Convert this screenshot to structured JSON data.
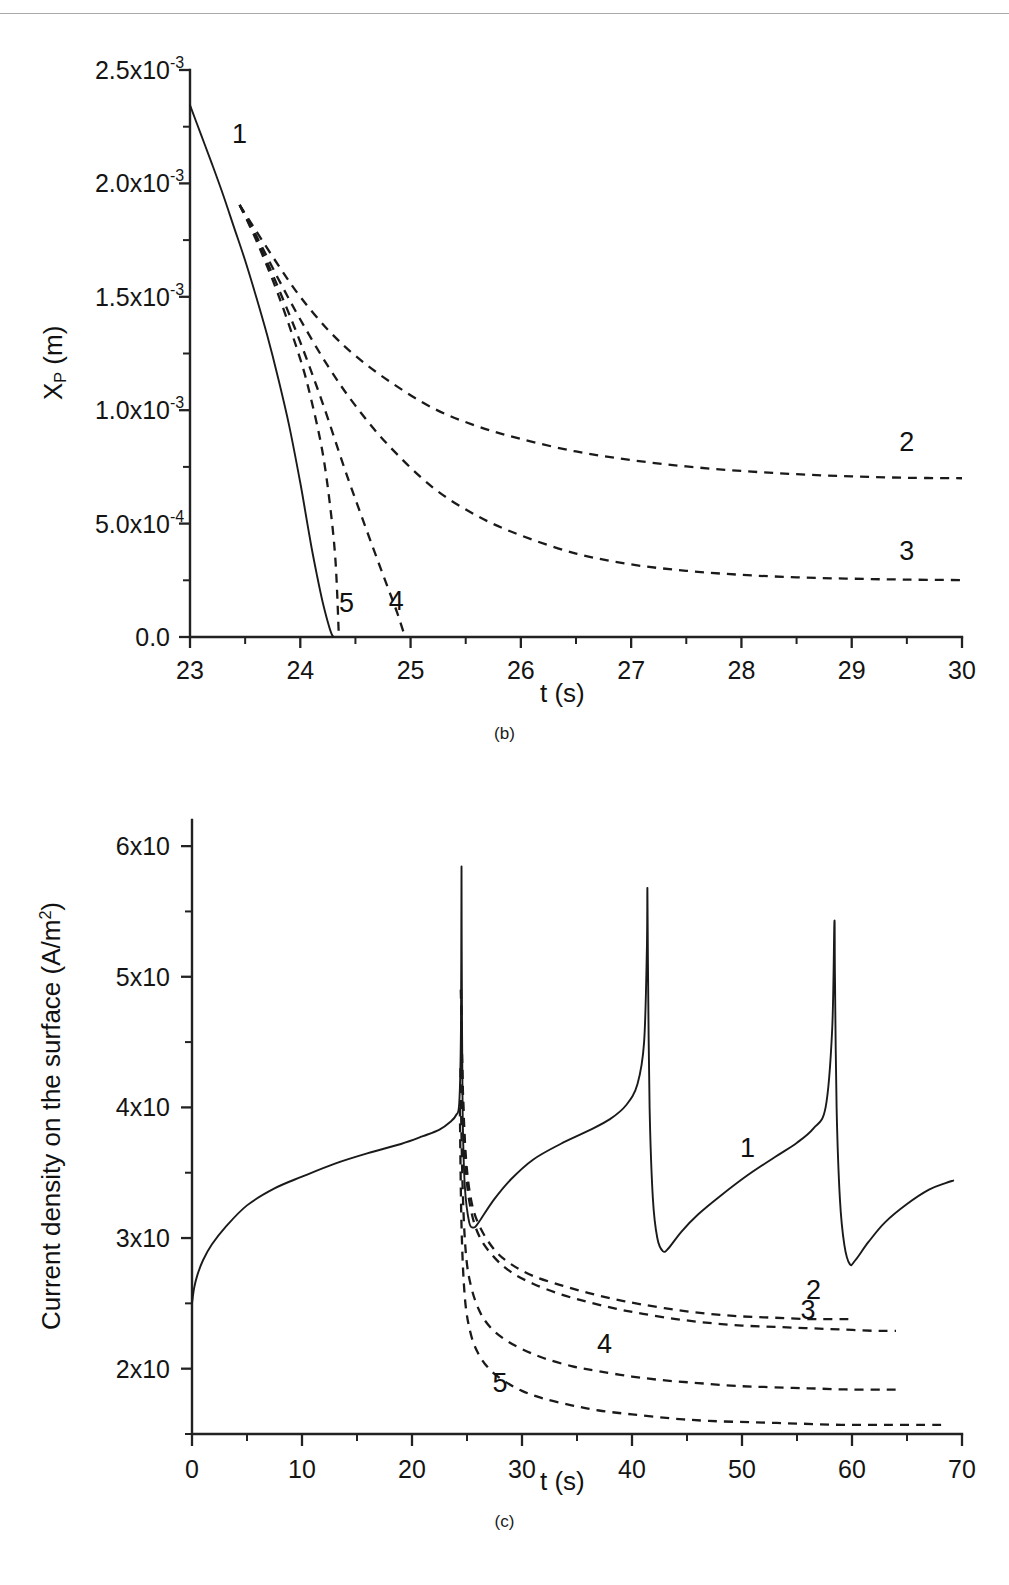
{
  "page": {
    "background": "#ffffff",
    "ink": "#1a1a1a"
  },
  "figure_b": {
    "caption": "(b)",
    "xlabel": "t (s)",
    "ylabel_main": "X",
    "ylabel_sub": "P",
    "ylabel_unit": " (m)",
    "ytick_labels": [
      "2.5x10",
      "2.0x10",
      "1.5x10",
      "1.0x10",
      "5.0x10",
      "0.0"
    ],
    "ytick_exponents": [
      "-3",
      "-3",
      "-3",
      "-3",
      "-4",
      ""
    ],
    "ytick_values": [
      0.0025,
      0.002,
      0.0015,
      0.001,
      0.0005,
      0
    ],
    "xtick_labels": [
      "23",
      "24",
      "25",
      "26",
      "27",
      "28",
      "29",
      "30"
    ],
    "xtick_values": [
      23,
      24,
      25,
      26,
      27,
      28,
      29,
      30
    ],
    "curve_labels": [
      "1",
      "2",
      "3",
      "4",
      "5"
    ]
  },
  "figure_c": {
    "caption": "(c)",
    "xlabel": "t (s)",
    "ylabel_main": "Current density on the surface (A/m",
    "ylabel_sup": "2",
    "ylabel_tail": ")",
    "ytick_labels": [
      "6x10",
      "5x10",
      "4x10",
      "3x10",
      "2x10"
    ],
    "ytick_exponents": [
      "8",
      "8",
      "8",
      "8",
      "8"
    ],
    "ytick_values": [
      600000000,
      500000000,
      400000000,
      300000000,
      200000000
    ],
    "xtick_labels": [
      "0",
      "10",
      "20",
      "30",
      "40",
      "50",
      "60",
      "70"
    ],
    "xtick_values": [
      0,
      10,
      20,
      30,
      40,
      50,
      60,
      70
    ],
    "curve_labels": [
      "1",
      "2",
      "3",
      "4",
      "5"
    ]
  },
  "chart_data": [
    {
      "type": "line",
      "id": "b",
      "title": "",
      "xlabel": "t (s)",
      "ylabel": "X_P (m)",
      "xlim": [
        23,
        30
      ],
      "ylim": [
        0,
        0.0025
      ],
      "grid": false,
      "legend": "inline-curve-numbers",
      "xticks": [
        23,
        24,
        25,
        26,
        27,
        28,
        29,
        30
      ],
      "yticks": [
        0,
        0.0005,
        0.001,
        0.0015,
        0.002,
        0.0025
      ],
      "ytick_text": [
        "0.0",
        "5.0x10^-4",
        "1.0x10^-3",
        "1.5x10^-3",
        "2.0x10^-3",
        "2.5x10^-3"
      ],
      "series": [
        {
          "name": "1",
          "style": "solid",
          "label_pos": [
            23.45,
            0.00218
          ],
          "x": [
            23.0,
            23.1,
            23.2,
            23.3,
            23.4,
            23.5,
            23.6,
            23.7,
            23.8,
            23.9,
            24.0,
            24.05,
            24.1,
            24.15,
            24.2,
            24.25,
            24.28,
            24.3
          ],
          "y": [
            0.002345,
            0.002215,
            0.002085,
            0.00195,
            0.001805,
            0.00166,
            0.0015,
            0.00133,
            0.00114,
            0.00093,
            0.00068,
            0.00054,
            0.0004,
            0.000275,
            0.00016,
            6.5e-05,
            1.8e-05,
            0.0
          ]
        },
        {
          "name": "2",
          "style": "dashed",
          "label_pos": [
            29.5,
            0.00082
          ],
          "x": [
            23.45,
            23.6,
            23.8,
            24.0,
            24.25,
            24.5,
            24.8,
            25.2,
            25.6,
            26.0,
            26.5,
            27.0,
            27.5,
            28.0,
            28.5,
            29.0,
            29.5,
            30.0
          ],
          "y": [
            0.001905,
            0.00179,
            0.00164,
            0.0015,
            0.001355,
            0.00124,
            0.00113,
            0.00101,
            0.00093,
            0.000873,
            0.000818,
            0.00078,
            0.000752,
            0.000732,
            0.000718,
            0.000708,
            0.000702,
            0.0007
          ]
        },
        {
          "name": "3",
          "style": "dashed",
          "label_pos": [
            29.5,
            0.00034
          ],
          "x": [
            23.45,
            23.6,
            23.8,
            24.0,
            24.25,
            24.5,
            24.8,
            25.2,
            25.6,
            26.0,
            26.5,
            27.0,
            27.5,
            28.0,
            28.5,
            29.0,
            29.5,
            30.0
          ],
          "y": [
            0.001905,
            0.00177,
            0.00158,
            0.0014,
            0.001195,
            0.00102,
            0.000845,
            0.00066,
            0.000535,
            0.000448,
            0.000368,
            0.00032,
            0.000292,
            0.000274,
            0.000263,
            0.000257,
            0.000253,
            0.000251
          ]
        },
        {
          "name": "4",
          "style": "dashed",
          "label_pos": [
            24.87,
            0.00012
          ],
          "x": [
            23.45,
            23.6,
            23.8,
            24.0,
            24.2,
            24.4,
            24.55,
            24.7,
            24.8,
            24.88,
            24.95
          ],
          "y": [
            0.001905,
            0.00176,
            0.00154,
            0.0013,
            0.001035,
            0.000745,
            0.00054,
            0.00034,
            0.00021,
            0.000105,
            0.0
          ]
        },
        {
          "name": "5",
          "style": "dashed",
          "label_pos": [
            24.42,
            0.00011
          ],
          "x": [
            23.45,
            23.6,
            23.8,
            24.0,
            24.1,
            24.2,
            24.27,
            24.32,
            24.35
          ],
          "y": [
            0.001905,
            0.00175,
            0.00151,
            0.001225,
            0.001045,
            0.00082,
            0.00058,
            0.00033,
            0.0
          ]
        }
      ]
    },
    {
      "type": "line",
      "id": "c",
      "title": "",
      "xlabel": "t (s)",
      "ylabel": "Current density on the surface (A/m^2)",
      "xlim": [
        0,
        70
      ],
      "ylim": [
        150000000,
        620000000
      ],
      "grid": false,
      "legend": "inline-curve-numbers",
      "xticks": [
        0,
        10,
        20,
        30,
        40,
        50,
        60,
        70
      ],
      "yticks": [
        200000000,
        300000000,
        400000000,
        500000000,
        600000000
      ],
      "ytick_text": [
        "2x10^8",
        "3x10^8",
        "4x10^8",
        "5x10^8",
        "6x10^8"
      ],
      "series": [
        {
          "name": "1",
          "style": "solid",
          "label_pos": [
            50.5,
            362000000
          ],
          "notes": "sawtooth: rises to sharp spikes at t=24.5, 41.4, 58.4 then drops to minima",
          "x": [
            0.0,
            0.2,
            0.5,
            1.0,
            1.8,
            3.0,
            5.0,
            7.5,
            10.0,
            13.0,
            16.0,
            19.0,
            21.0,
            22.5,
            23.5,
            24.0,
            24.3,
            24.45,
            24.5,
            24.52,
            24.6,
            24.8,
            25.2,
            25.6,
            25.9,
            26.3,
            27.5,
            29.0,
            31.0,
            33.5,
            36.0,
            38.0,
            39.5,
            40.5,
            41.1,
            41.35,
            41.4,
            41.45,
            41.6,
            41.9,
            42.3,
            42.8,
            43.3,
            44.5,
            46.0,
            48.0,
            50.5,
            53.0,
            55.0,
            56.5,
            57.6,
            58.2,
            58.4,
            58.45,
            58.6,
            58.9,
            59.3,
            59.8,
            60.3,
            61.5,
            63.0,
            65.0,
            67.0,
            68.5,
            69.2
          ],
          "y": [
            250000000,
            262000000,
            272000000,
            283000000,
            295000000,
            308000000,
            325000000,
            338000000,
            347000000,
            357000000,
            365000000,
            372000000,
            378000000,
            383000000,
            389000000,
            394000000,
            404000000,
            460000000,
            583000000,
            520000000,
            400000000,
            340000000,
            312000000,
            308000000,
            310000000,
            315000000,
            330000000,
            345000000,
            360000000,
            372000000,
            382000000,
            391000000,
            402000000,
            418000000,
            450000000,
            520000000,
            568000000,
            510000000,
            400000000,
            330000000,
            300000000,
            290000000,
            292000000,
            305000000,
            318000000,
            332000000,
            348000000,
            362000000,
            373000000,
            384000000,
            400000000,
            460000000,
            542000000,
            500000000,
            400000000,
            330000000,
            295000000,
            280000000,
            283000000,
            297000000,
            312000000,
            326000000,
            337000000,
            342000000,
            344000000
          ]
        },
        {
          "name": "2",
          "style": "dashed",
          "label_pos": [
            56.5,
            253000000
          ],
          "x": [
            24.45,
            24.6,
            24.9,
            25.4,
            26.2,
            27.5,
            29.0,
            31.0,
            33.5,
            36.0,
            38.5,
            41.0,
            44.0,
            47.0,
            50.0,
            53.0,
            56.0,
            58.5,
            60.0
          ],
          "y": [
            490000000,
            420000000,
            362000000,
            328000000,
            308000000,
            291000000,
            280000000,
            271000000,
            264000000,
            258000000,
            253000000,
            249000000,
            245000000,
            242000000,
            240000000,
            239000000,
            238000000,
            238000000,
            238000000
          ]
        },
        {
          "name": "3",
          "style": "dashed",
          "label_pos": [
            56.0,
            238000000
          ],
          "x": [
            24.45,
            24.6,
            24.9,
            25.4,
            26.2,
            27.5,
            29.0,
            31.0,
            33.5,
            36.0,
            38.5,
            41.0,
            44.0,
            47.0,
            50.0,
            53.0,
            56.0,
            59.0,
            62.0,
            64.0
          ],
          "y": [
            490000000,
            415000000,
            352000000,
            320000000,
            300000000,
            285000000,
            274000000,
            265000000,
            257000000,
            251000000,
            246000000,
            242000000,
            238000000,
            235000000,
            233000000,
            232000000,
            231000000,
            230000000,
            229000000,
            229000000
          ]
        },
        {
          "name": "4",
          "style": "dashed",
          "label_pos": [
            37.5,
            212000000
          ],
          "x": [
            24.4,
            24.6,
            24.9,
            25.4,
            26.2,
            27.2,
            28.5,
            30.0,
            32.0,
            34.5,
            37.0,
            40.0,
            43.0,
            46.0,
            49.0,
            52.0,
            56.0,
            60.0,
            64.0
          ],
          "y": [
            430000000,
            340000000,
            288000000,
            262000000,
            243000000,
            231000000,
            222000000,
            215000000,
            208000000,
            202000000,
            198000000,
            194000000,
            191000000,
            189000000,
            187000000,
            186000000,
            185000000,
            184000000,
            184000000
          ]
        },
        {
          "name": "5",
          "style": "dashed",
          "label_pos": [
            28.0,
            182000000
          ],
          "x": [
            24.35,
            24.5,
            24.8,
            25.3,
            26.0,
            27.0,
            28.3,
            30.0,
            32.0,
            34.5,
            37.0,
            40.0,
            43.5,
            47.0,
            51.0,
            55.0,
            59.0,
            63.0,
            67.0,
            68.5
          ],
          "y": [
            400000000,
            310000000,
            255000000,
            228000000,
            212000000,
            200000000,
            191000000,
            183000000,
            177000000,
            172000000,
            168000000,
            165000000,
            162000000,
            160000000,
            159000000,
            158000000,
            157000000,
            157000000,
            157000000,
            157000000
          ]
        }
      ]
    }
  ]
}
